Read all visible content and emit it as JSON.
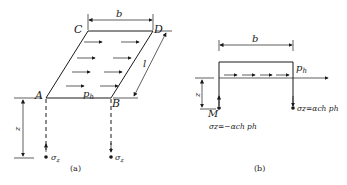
{
  "figure_a": {
    "caption": "(a)",
    "corners": {
      "A": "A",
      "B": "B",
      "C": "C",
      "D": "D"
    },
    "dim_width": "b",
    "dim_length": "l",
    "dim_depth": "z",
    "load_label": "p",
    "load_sub": "h",
    "stress_left": "σ",
    "stress_left_sub": "z",
    "stress_right": "σ",
    "stress_right_sub": "z"
  },
  "figure_b": {
    "caption": "(b)",
    "dim_width": "b",
    "dim_depth": "z",
    "point_label": "M",
    "load_label": "p",
    "load_sub": "h",
    "stress_left_text": "σz=−αch ph",
    "stress_right_text": "σz=αch ph"
  },
  "colors": {
    "ink": "#1a1a1a",
    "background": "#ffffff"
  }
}
